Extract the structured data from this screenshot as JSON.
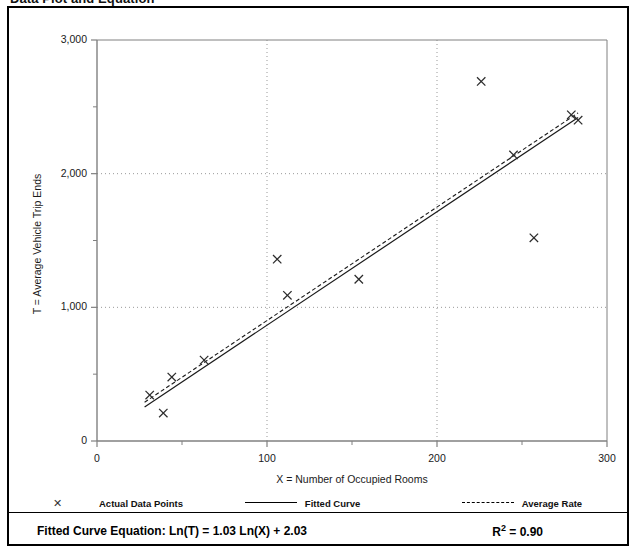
{
  "page": {
    "title": "Data Plot and Equation"
  },
  "legend": {
    "items": [
      {
        "label": "Actual Data Points",
        "marker": "x-marker-icon",
        "style": "marker"
      },
      {
        "label": "Fitted Curve",
        "marker": "solid-line-icon",
        "style": "solid"
      },
      {
        "label": "Average Rate",
        "marker": "dashed-line-icon",
        "style": "dashed"
      }
    ]
  },
  "footer": {
    "equation_label": "Fitted Curve Equation:",
    "equation": "Ln(T) = 1.03 Ln(X) + 2.03",
    "equation_full": "Fitted Curve Equation:  Ln(T) = 1.03 Ln(X) + 2.03",
    "r_squared_symbol": "R",
    "r_squared_exp": "2",
    "r_squared_value": "= 0.90",
    "r_squared_full": "R2 = 0.90"
  },
  "axes": {
    "x_ticks": [
      "0",
      "100",
      "200",
      "300"
    ],
    "y_ticks": [
      "0",
      "1,000",
      "2,000",
      "3,000"
    ]
  },
  "colors": {
    "frame": "#000000",
    "axis": "#808080",
    "gridline": "#999999",
    "fitted_curve": "#1a1a1a",
    "average_rate": "#1a1a1a",
    "marker": "#2b2b2b",
    "background": "#ffffff"
  },
  "chart_data": {
    "type": "scatter",
    "title": "Data Plot and Equation",
    "xlabel": "X = Number of Occupied Rooms",
    "ylabel": "T = Average Vehicle Trip Ends",
    "xlim": [
      0,
      300
    ],
    "ylim": [
      0,
      3000
    ],
    "x_major_ticks": [
      0,
      100,
      200,
      300
    ],
    "y_major_ticks": [
      0,
      1000,
      2000,
      3000
    ],
    "x_minor_tick_interval": 50,
    "y_minor_tick_interval": 500,
    "grid": true,
    "grid_style": "dotted",
    "legend_position": "below-plot",
    "series": [
      {
        "name": "Actual Data Points",
        "type": "scatter",
        "marker": "x",
        "points": [
          {
            "x": 31,
            "y": 344
          },
          {
            "x": 39,
            "y": 209
          },
          {
            "x": 44,
            "y": 478
          },
          {
            "x": 63,
            "y": 605
          },
          {
            "x": 106,
            "y": 1360
          },
          {
            "x": 112,
            "y": 1090
          },
          {
            "x": 154,
            "y": 1210
          },
          {
            "x": 226,
            "y": 2690
          },
          {
            "x": 245,
            "y": 2140
          },
          {
            "x": 257,
            "y": 1520
          },
          {
            "x": 279,
            "y": 2440
          },
          {
            "x": 283,
            "y": 2400
          }
        ]
      },
      {
        "name": "Fitted Curve",
        "type": "line",
        "style": "solid",
        "equation": "Ln(T) = 1.03 Ln(X) + 2.03",
        "r_squared": 0.9,
        "points": [
          {
            "x": 28,
            "y": 255
          },
          {
            "x": 283,
            "y": 2420
          }
        ]
      },
      {
        "name": "Average Rate",
        "type": "line",
        "style": "dashed",
        "points": [
          {
            "x": 28,
            "y": 290
          },
          {
            "x": 283,
            "y": 2455
          }
        ]
      }
    ],
    "annotations": [
      {
        "text": "Fitted Curve Equation:  Ln(T) = 1.03 Ln(X) + 2.03",
        "position": "footer-left"
      },
      {
        "text": "R2 = 0.90",
        "position": "footer-right"
      }
    ]
  }
}
